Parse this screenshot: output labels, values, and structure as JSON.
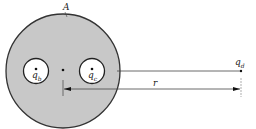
{
  "diagram": {
    "conductor_label": "A",
    "charges": {
      "b": {
        "symbol": "q",
        "subscript": "b"
      },
      "c": {
        "symbol": "q",
        "subscript": "c"
      },
      "d": {
        "symbol": "q",
        "subscript": "d"
      }
    },
    "distance_label": "r",
    "colors": {
      "conductor_fill": "#c8c8c8",
      "outline": "#333333",
      "cavity_fill": "#ffffff"
    }
  }
}
